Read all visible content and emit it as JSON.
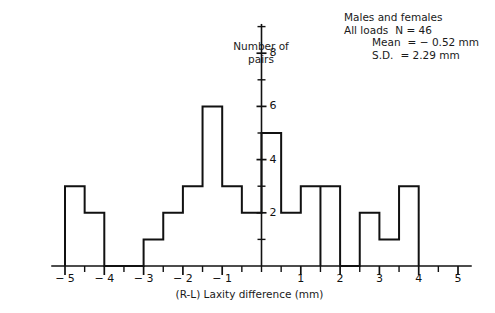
{
  "annotation": {
    "line1": "Males and females",
    "line2_label": "All loads",
    "line2_value": "N  =  46",
    "line3_label": "Mean",
    "line3_value": "=  − 0.52 mm",
    "line4_label": "S.D.",
    "line4_value": "=  2.29 mm"
  },
  "axes": {
    "ytitle_line1": "Number of",
    "ytitle_line2": "pairs",
    "xtitle": "(R-L) Laxity difference (mm)"
  },
  "chart_data": {
    "type": "bar",
    "title": "",
    "subtitle": "",
    "xlabel": "(R-L) Laxity difference (mm)",
    "ylabel": "Number of pairs",
    "xlim": [
      -5.35,
      5.35
    ],
    "ylim": [
      0,
      9.1
    ],
    "grid": false,
    "legend_position": "none",
    "bin_width": 0.5,
    "xticks_major": [
      -5,
      -4,
      -3,
      -2,
      -1,
      1,
      2,
      3,
      4,
      5
    ],
    "xtick_labels": [
      "− 5",
      "− 4",
      "− 3",
      "− 2",
      "− 1",
      "1",
      "2",
      "3",
      "4",
      "5"
    ],
    "xticks_minor": [
      -4.5,
      -3.5,
      -2.5,
      -1.5,
      -0.5,
      0,
      0.5,
      1.5,
      2.5,
      3.5,
      4.5
    ],
    "yticks_major": [
      2,
      4,
      6,
      8
    ],
    "ytick_labels": [
      "2",
      "4",
      "6",
      "8"
    ],
    "yticks_minor": [
      1,
      3,
      5,
      7,
      9
    ],
    "bin_starts": [
      -5,
      -4.5,
      -4,
      -3.5,
      -3,
      -2.5,
      -2,
      -1.5,
      -1,
      -0.5,
      0,
      0.5,
      1,
      1.5,
      2,
      2.5,
      3,
      3.5
    ],
    "values": [
      3,
      2,
      0,
      0,
      1,
      2,
      3,
      6,
      3,
      2,
      5,
      2,
      3,
      3,
      0,
      0,
      2,
      1
    ],
    "bars": [
      {
        "x0": -5.0,
        "x1": -4.5,
        "y": 3
      },
      {
        "x0": -4.5,
        "x1": -4.0,
        "y": 2
      },
      {
        "x0": -3.0,
        "x1": -2.5,
        "y": 1
      },
      {
        "x0": -2.5,
        "x1": -2.0,
        "y": 2
      },
      {
        "x0": -2.0,
        "x1": -1.5,
        "y": 3
      },
      {
        "x0": -1.5,
        "x1": -1.0,
        "y": 6
      },
      {
        "x0": -1.0,
        "x1": -0.5,
        "y": 3
      },
      {
        "x0": -0.5,
        "x1": 0.0,
        "y": 2
      },
      {
        "x0": 0.0,
        "x1": 0.5,
        "y": 5
      },
      {
        "x0": 0.5,
        "x1": 1.0,
        "y": 2
      },
      {
        "x0": 1.0,
        "x1": 1.5,
        "y": 3
      },
      {
        "x0": 1.5,
        "x1": 2.0,
        "y": 3
      },
      {
        "x0": 2.5,
        "x1": 3.0,
        "y": 2
      },
      {
        "x0": 3.0,
        "x1": 3.5,
        "y": 1
      },
      {
        "x0": 3.5,
        "x1": 4.0,
        "y": 3
      }
    ],
    "n": 46,
    "mean": -0.52,
    "sd": 2.29,
    "annotations": [
      "Males and females",
      "All loads   N = 46",
      "Mean = − 0.52 mm",
      "S.D. = 2.29 mm"
    ]
  }
}
